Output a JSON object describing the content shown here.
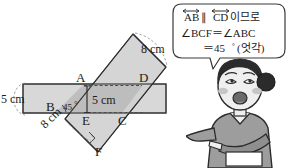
{
  "figure": {
    "type": "geometry-diagram",
    "vertices": [
      {
        "id": "A",
        "label": "A",
        "x": 83,
        "y": 85
      },
      {
        "id": "B",
        "label": "B",
        "x": 55,
        "y": 110
      },
      {
        "id": "C",
        "label": "C",
        "x": 122,
        "y": 113
      },
      {
        "id": "D",
        "label": "D",
        "x": 143,
        "y": 85
      },
      {
        "id": "E",
        "label": "E",
        "x": 87,
        "y": 113
      },
      {
        "id": "F",
        "label": "F",
        "x": 98,
        "y": 146
      }
    ],
    "dimensions": [
      {
        "id": "strip-h-width",
        "label": "5 cm",
        "position": "left-outside"
      },
      {
        "id": "segment-ae",
        "label": "5 cm",
        "position": "interior-vertical"
      },
      {
        "id": "strip-d-width-top",
        "label": "8 cm",
        "position": "top-right"
      },
      {
        "id": "strip-d-width-bottom",
        "label": "8 cm",
        "position": "bottom-left"
      }
    ],
    "angle_marks": [
      {
        "id": "angle-b",
        "label": "45",
        "degree_symbol": "°",
        "at": "B"
      },
      {
        "id": "right-angle-f",
        "label": "",
        "at": "F"
      }
    ],
    "colors": {
      "strip_horizontal_fill": "#d6d6d6",
      "strip_diagonal_fill": "#cdcdcd",
      "overlap_fill": "#b9b9b9",
      "stroke": "#3a3a3a",
      "dashed_stroke": "#5a5a5a"
    }
  },
  "speech_bubble": {
    "lines": [
      {
        "id": "line-1",
        "parts": [
          {
            "text": "AB",
            "overline": "double-arrow"
          },
          {
            "text": "∥"
          },
          {
            "text": "CD",
            "overline": "double-arrow"
          },
          {
            "text": "이므로"
          }
        ],
        "plain": "AB ∥ CD이므로"
      },
      {
        "id": "line-2",
        "plain": "∠BCF = ∠ABC"
      },
      {
        "id": "line-3",
        "plain": "= 45° (엇각)"
      }
    ],
    "line1_ab": "AB",
    "line1_par": "∥",
    "line1_cd": "CD",
    "line1_tail": "이므로",
    "line2": "∠BCF＝∠ABC",
    "line3_eq": "＝45",
    "line3_deg": "°",
    "line3_paren": "(엇각)"
  },
  "character": {
    "name": "teacher-character",
    "description": "cartoon woman with hair bun pointing left",
    "colors": {
      "hair": "#2b2b2b",
      "skin": "#efefef",
      "cheek": "#c9c9c9",
      "clothes": "#9a9a9a",
      "clothes_dark": "#7b7b7b",
      "mouth": "#6a6a6a",
      "outline": "#2b2b2b"
    }
  }
}
